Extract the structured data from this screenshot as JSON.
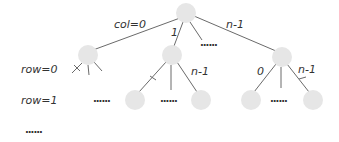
{
  "diagram": {
    "type": "tree",
    "colors": {
      "node_fill": "#e6e6e6",
      "edge": "#6a6a6a",
      "text": "#333333"
    },
    "row_labels": [
      "row=0",
      "row=1",
      "......"
    ],
    "edge_labels": {
      "root_left": "col=0",
      "root_middle": "1",
      "root_right": "n-1",
      "mid_right": "n-1",
      "right_left": "0",
      "right_right": "n-1"
    },
    "ellipsis": "......",
    "nodes": [
      {
        "id": "root",
        "level": 0
      },
      {
        "id": "l1-a",
        "level": 1,
        "branch": "col=0"
      },
      {
        "id": "l1-b",
        "level": 1,
        "branch": "1"
      },
      {
        "id": "l1-c",
        "level": 1,
        "branch": "n-1"
      },
      {
        "id": "l2-b1",
        "level": 2,
        "parent": "l1-b",
        "pruned_edge": true
      },
      {
        "id": "l2-b2",
        "level": 2,
        "parent": "l1-b",
        "branch": "n-1"
      },
      {
        "id": "l2-c1",
        "level": 2,
        "parent": "l1-c",
        "branch": "0"
      },
      {
        "id": "l2-c2",
        "level": 2,
        "parent": "l1-c",
        "branch": "n-1",
        "pruned_edge": true
      }
    ]
  }
}
